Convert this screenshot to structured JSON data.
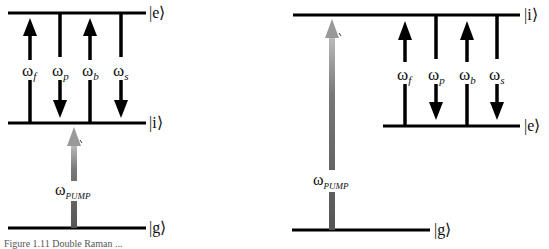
{
  "left_panel": {
    "levels": [
      {
        "name": "e",
        "label": "|e⟩",
        "y": 13
      },
      {
        "name": "i",
        "label": "|i⟩",
        "y": 123
      },
      {
        "name": "g",
        "label": "|g⟩",
        "y": 228
      }
    ],
    "transitions": [
      {
        "symbol": "ω",
        "sub": "f",
        "direction": "up"
      },
      {
        "symbol": "ω",
        "sub": "p",
        "direction": "down"
      },
      {
        "symbol": "ω",
        "sub": "b",
        "direction": "up"
      },
      {
        "symbol": "ω",
        "sub": "s",
        "direction": "down"
      }
    ],
    "pump": {
      "symbol": "ω",
      "sub": "PUMP",
      "from": "g",
      "to": "i"
    }
  },
  "right_panel": {
    "levels": [
      {
        "name": "i",
        "label": "|i⟩",
        "y": 15
      },
      {
        "name": "e",
        "label": "|e⟩",
        "y": 126
      },
      {
        "name": "g",
        "label": "|g⟩",
        "y": 230
      }
    ],
    "transitions": [
      {
        "symbol": "ω",
        "sub": "f",
        "direction": "up"
      },
      {
        "symbol": "ω",
        "sub": "p",
        "direction": "down"
      },
      {
        "symbol": "ω",
        "sub": "b",
        "direction": "up"
      },
      {
        "symbol": "ω",
        "sub": "s",
        "direction": "down"
      }
    ],
    "pump": {
      "symbol": "ω",
      "sub": "PUMP",
      "from": "g",
      "to": "i"
    }
  },
  "caption": "Figure 1.11 Double Raman ..."
}
